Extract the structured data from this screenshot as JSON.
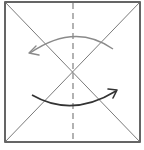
{
  "diagram": {
    "type": "origami-fold-step",
    "square": {
      "x": 5,
      "y": 2,
      "size_w": 135,
      "size_h": 140,
      "stroke": "#333333"
    },
    "crease_lines": [
      {
        "kind": "diagonal",
        "from": [
          5,
          2
        ],
        "to": [
          140,
          142
        ],
        "color": "#6b6b6b"
      },
      {
        "kind": "diagonal",
        "from": [
          140,
          2
        ],
        "to": [
          5,
          142
        ],
        "color": "#6b6b6b"
      }
    ],
    "fold_line": {
      "kind": "valley-dashed-vertical",
      "x": 73,
      "color": "#8a8a8a"
    },
    "arrows": [
      {
        "name": "upper-arrow",
        "direction": "left",
        "color": "#8a8a8a"
      },
      {
        "name": "lower-arrow",
        "direction": "right",
        "color": "#333333"
      }
    ]
  }
}
